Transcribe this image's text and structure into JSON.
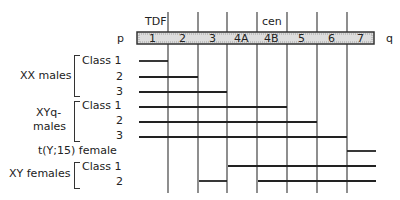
{
  "top_labels": {
    "tdf": "TDF",
    "cen": "cen"
  },
  "arm_labels": {
    "p": "p",
    "q": "q"
  },
  "intervals": [
    "1",
    "2",
    "3",
    "4A",
    "4B",
    "5",
    "6",
    "7"
  ],
  "groups": [
    {
      "name": "XX males",
      "rows": [
        {
          "label": "Class 1",
          "start": 0,
          "end": 1
        },
        {
          "label": "2",
          "start": 0,
          "end": 2
        },
        {
          "label": "3",
          "start": 0,
          "end": 3
        }
      ]
    },
    {
      "name": "XYq-\nmales",
      "name_line1": "XYq-",
      "name_line2": "males",
      "rows": [
        {
          "label": "Class 1",
          "start": 0,
          "end": 5
        },
        {
          "label": "2",
          "start": 0,
          "end": 6
        },
        {
          "label": "3",
          "start": 0,
          "end": 7
        }
      ]
    },
    {
      "name": "t(Y;15) female",
      "rows": [
        {
          "label": "t(Y;15) female",
          "start": 7,
          "end": 8
        }
      ]
    },
    {
      "name": "XY females",
      "rows": [
        {
          "label": "Class 1",
          "start": 3,
          "end": 8
        },
        {
          "label": "2",
          "start": 2,
          "end": 3,
          "start2": 4,
          "end2": 8
        }
      ]
    }
  ]
}
